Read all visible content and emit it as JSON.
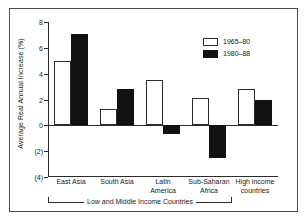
{
  "chart_data": {
    "type": "bar",
    "title": "",
    "subtitle": "",
    "xlabel": "",
    "ylabel": "Average Real Annual Increase (%)",
    "ylim": [
      -4,
      8
    ],
    "yticks": [
      8,
      6,
      4,
      2,
      0,
      -2,
      -4
    ],
    "ytick_labels": [
      "8",
      "6",
      "4",
      "2",
      "0",
      "(2)",
      "(4)"
    ],
    "grid": false,
    "legend_position": "top-right",
    "categories": [
      "East Asia",
      "South Asia",
      "Latin America",
      "Sub-Saharan Africa",
      "High income countries"
    ],
    "category_lines": [
      [
        "East Asia"
      ],
      [
        "South Asia"
      ],
      [
        "Latin",
        "America"
      ],
      [
        "Sub-Saharan",
        "Africa"
      ],
      [
        "High income",
        "countries"
      ]
    ],
    "series": [
      {
        "name": "1965–80",
        "style": "open",
        "color": "#ffffff",
        "edge_color": "#2b2b2b",
        "values": [
          5.0,
          1.3,
          3.5,
          2.1,
          2.8
        ]
      },
      {
        "name": "1980–88",
        "style": "filled",
        "color": "#111111",
        "edge_color": "#111111",
        "values": [
          7.1,
          2.8,
          -0.7,
          -2.5,
          2.0
        ]
      }
    ],
    "annotations": [
      {
        "text": "Low and Middle Income Countries",
        "type": "bracket",
        "spans_categories": [
          "East Asia",
          "Sub-Saharan Africa"
        ]
      }
    ]
  },
  "legend": {
    "items": [
      {
        "label": "1965–80",
        "swatch": "open"
      },
      {
        "label": "1980–88",
        "swatch": "filled"
      }
    ]
  },
  "axes": {
    "y_title": "Average Real Annual Increase (%)",
    "y_tick_labels": [
      "8",
      "6",
      "4",
      "2",
      "0",
      "(2)",
      "(4)"
    ]
  },
  "bracket": {
    "label": "Low and Middle Income Countries"
  }
}
